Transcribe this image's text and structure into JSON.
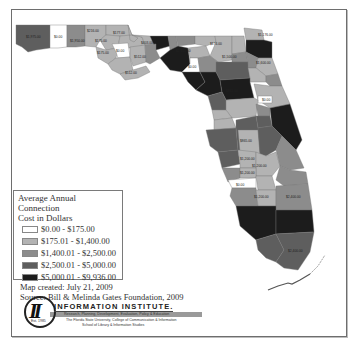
{
  "map": {
    "region": "Florida counties",
    "colors": {
      "class1": "#ffffff",
      "class2": "#b3b3b3",
      "class3": "#8c8c8c",
      "class4": "#5e5e5e",
      "class5": "#1c1c1c"
    },
    "visible_labels": {
      "escambia": "$1,975.00",
      "santa_rosa": "$0.00",
      "okaloosa": "$1,950.00",
      "walton": "$216.00",
      "holmes_washington": "$175.00",
      "bay": "$175.00",
      "calhoun": "$0.00",
      "jackson": "$377.00",
      "gulf": "$512.00",
      "franklin": "$512.00",
      "gadsden": "$403.00",
      "leon": "$1,600.00",
      "madison_area": "$0.00",
      "nassau": "$1,176.00",
      "alachua": "$1,600.00",
      "marion": "$1,600.00",
      "volusia": "$0.00",
      "polk": "$865.00",
      "hardee": "$1,200.00",
      "highlands": "$1,200.00",
      "charlotte": "$0.00",
      "lee": "$1,200.00",
      "palm_beach": "$2,400.00",
      "miami_dade": "$2,400.00"
    }
  },
  "legend": {
    "title_line1": "Average Annual Connection",
    "title_line2": "Cost in Dollars",
    "items": [
      {
        "label": "$0.00 - $175.00",
        "color": "#ffffff"
      },
      {
        "label": "$175.01 - $1,400.00",
        "color": "#b3b3b3"
      },
      {
        "label": "$1,400.01 - $2,500.00",
        "color": "#8c8c8c"
      },
      {
        "label": "$2,500.01 - $5,000.00",
        "color": "#5e5e5e"
      },
      {
        "label": "$5,000.01 - $9,936.00",
        "color": "#1c1c1c"
      }
    ]
  },
  "notes": {
    "created": "Map created: July 21, 2009",
    "source": "Source: Bill & Melinda Gates Foundation, 2009"
  },
  "logo": {
    "initials": "II",
    "est": "Est. 1985",
    "name": "INFORMATION INSTITUTE.",
    "tagline": "Research, Planning, Development, Evaluation, Policy & Education",
    "line2": "The Florida State University, College of Communication & Information",
    "line3": "School of Library & Information Studies"
  }
}
